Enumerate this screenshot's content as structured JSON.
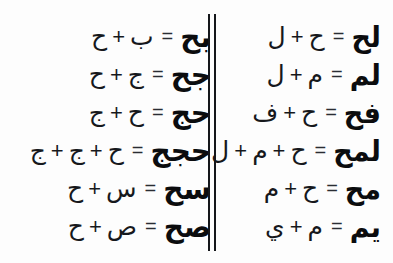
{
  "figure": {
    "background_color": "#fdfdfd",
    "ink_color": "#16181c",
    "operator_plus": "+",
    "operator_equals": "="
  },
  "divider": {
    "name": "double-vertical-rule",
    "rule_count": 2,
    "color": "#15171b"
  },
  "columns": {
    "right": {
      "name": "right-column",
      "rows": [
        {
          "operands": [
            "ل",
            "ح"
          ],
          "result": "لح",
          "equation": "ل + ح = لح"
        },
        {
          "operands": [
            "ل",
            "م"
          ],
          "result": "لم",
          "equation": "ل + م = لم"
        },
        {
          "operands": [
            "ف",
            "ح"
          ],
          "result": "فح",
          "equation": "ف + ح = فح"
        },
        {
          "operands": [
            "ل",
            "م",
            "ح"
          ],
          "result": "لمح",
          "equation": "ل + م + ح = لمح"
        },
        {
          "operands": [
            "م",
            "ح"
          ],
          "result": "مح",
          "equation": "م + ح = مح"
        },
        {
          "operands": [
            "ي",
            "م"
          ],
          "result": "يم",
          "equation": "ي + م = يم"
        }
      ]
    },
    "left": {
      "name": "left-column",
      "rows": [
        {
          "operands": [
            "ب",
            "ح"
          ],
          "result": "بح",
          "equation": "ب + ح = بح"
        },
        {
          "operands": [
            "ج",
            "ح"
          ],
          "result": "جح",
          "equation": "ج + ح = جح"
        },
        {
          "operands": [
            "ح",
            "ج"
          ],
          "result": "حج",
          "equation": "ح + ج = حج"
        },
        {
          "operands": [
            "ح",
            "ج",
            "ج"
          ],
          "result": "حجج",
          "equation": "ح + ج + ج = حجج"
        },
        {
          "operands": [
            "س",
            "ح"
          ],
          "result": "سح",
          "equation": "س + ح = سح"
        },
        {
          "operands": [
            "ص",
            "ح"
          ],
          "result": "صح",
          "equation": "ص + ح = صح"
        }
      ]
    }
  }
}
